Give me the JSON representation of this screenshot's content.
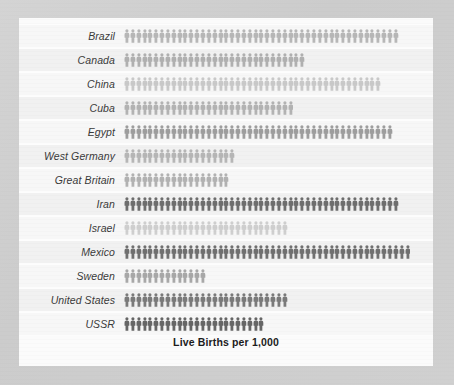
{
  "chart_data": {
    "type": "bar",
    "subtype": "pictogram",
    "title": "Live Births per 1,000",
    "xlabel": "",
    "ylabel": "",
    "unit_label": "person-icon",
    "icon_value": 1,
    "categories": [
      "Brazil",
      "Canada",
      "China",
      "Cuba",
      "Egypt",
      "West Germany",
      "Great Britain",
      "Iran",
      "Israel",
      "Mexico",
      "Sweden",
      "United States",
      "USSR"
    ],
    "values": [
      47,
      31,
      44,
      29,
      46,
      19,
      18,
      47,
      28,
      49,
      14,
      28,
      24
    ],
    "series": [
      {
        "name": "Live Births per 1,000",
        "values": [
          47,
          31,
          44,
          29,
          46,
          19,
          18,
          47,
          28,
          49,
          14,
          28,
          24
        ]
      }
    ],
    "icon_colors": [
      "#b7b7b7",
      "#b0b0b0",
      "#c9c9c9",
      "#b3b3b3",
      "#9e9e9e",
      "#b6b6b6",
      "#b2b2b2",
      "#6e6e6e",
      "#cfcfcf",
      "#707070",
      "#a8a8a8",
      "#7a7a7a",
      "#666666"
    ],
    "xlim": [
      0,
      52
    ],
    "grid": false,
    "legend": "none"
  },
  "colors": {
    "frame_background": "#d0d0d0",
    "panel_background": "#fbfbfb",
    "row_background": "#f7f7f7",
    "row_background_alt": "#f1f1f1",
    "label_text": "#3a3a3a",
    "title_text": "#1c1c1c"
  }
}
